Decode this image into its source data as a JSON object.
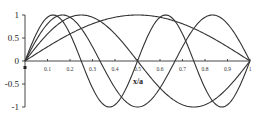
{
  "chart_data": {
    "type": "line",
    "title": "",
    "xlabel": "x/a",
    "ylabel": "",
    "xlim": [
      0,
      1
    ],
    "ylim": [
      -1,
      1
    ],
    "grid": false,
    "legend": null,
    "x_ticks": [
      "0.1",
      "0.2",
      "0.3",
      "0.4",
      "0.5",
      "0.6",
      "0.7",
      "0.8",
      "0.9",
      "1"
    ],
    "x_tick_values": [
      0.1,
      0.2,
      0.3,
      0.4,
      0.5,
      0.6,
      0.7,
      0.8,
      0.9,
      1
    ],
    "y_ticks": [
      "1",
      "0.5",
      "0",
      "-0.5",
      "-1"
    ],
    "y_tick_values": [
      1,
      0.5,
      0,
      -0.5,
      -1
    ],
    "series": [
      {
        "name": "mode 1",
        "function": "sin(1*pi*x)",
        "n": 1,
        "x": [
          0,
          0.125,
          0.25,
          0.375,
          0.5,
          0.625,
          0.75,
          0.875,
          1
        ],
        "values": [
          0,
          0.38,
          0.71,
          0.92,
          1,
          0.92,
          0.71,
          0.38,
          0
        ]
      },
      {
        "name": "mode 2",
        "function": "sin(2*pi*x)",
        "n": 2,
        "x": [
          0,
          0.125,
          0.25,
          0.375,
          0.5,
          0.625,
          0.75,
          0.875,
          1
        ],
        "values": [
          0,
          0.71,
          1,
          0.71,
          0,
          -0.71,
          -1,
          -0.71,
          0
        ]
      },
      {
        "name": "mode 3",
        "function": "sin(3*pi*x)",
        "n": 3,
        "x": [
          0,
          0.167,
          0.333,
          0.5,
          0.667,
          0.833,
          1
        ],
        "values": [
          0,
          1,
          0,
          -1,
          0,
          1,
          0
        ]
      },
      {
        "name": "mode 4",
        "function": "sin(4*pi*x)",
        "n": 4,
        "x": [
          0,
          0.125,
          0.25,
          0.375,
          0.5,
          0.625,
          0.75,
          0.875,
          1
        ],
        "values": [
          0,
          1,
          0,
          -1,
          0,
          1,
          0,
          -1,
          0
        ]
      }
    ]
  },
  "layout": {
    "x0_px": 25,
    "x1_px": 250,
    "y_top_px": 15,
    "y_zero_px": 61,
    "y_bottom_px": 106,
    "line_color": "#333333"
  }
}
